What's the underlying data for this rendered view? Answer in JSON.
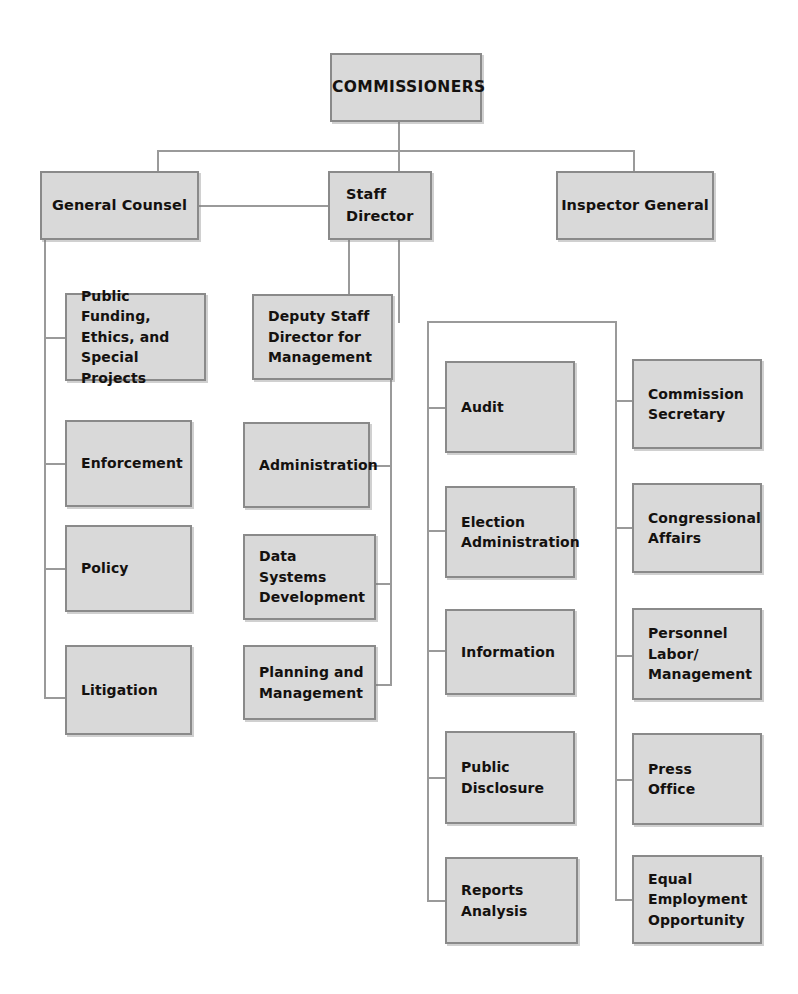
{
  "chart": {
    "type": "org-chart",
    "colors": {
      "box_fill": "#d9d9d9",
      "box_border": "#8a8a8a",
      "line": "#9a9a9a",
      "text": "#14110f",
      "background": "#ffffff"
    }
  },
  "nodes": {
    "root": {
      "label": "COMMISSIONERS"
    },
    "tier2": {
      "general_counsel": {
        "label": "General Counsel"
      },
      "staff_director": {
        "label": "Staff\nDirector"
      },
      "inspector_general": {
        "label": "Inspector General"
      }
    },
    "tier3": {
      "deputy_staff_director": {
        "label": "Deputy Staff\nDirector for\nManagement"
      }
    },
    "general_counsel_units": [
      {
        "label": "Public Funding,\nEthics, and\nSpecial Projects"
      },
      {
        "label": "Enforcement"
      },
      {
        "label": "Policy"
      },
      {
        "label": "Litigation"
      }
    ],
    "deputy_staff_director_units": [
      {
        "label": "Administration"
      },
      {
        "label": "Data\nSystems\nDevelopment"
      },
      {
        "label": "Planning and\nManagement"
      }
    ],
    "staff_director_units_left": [
      {
        "label": "Audit"
      },
      {
        "label": "Election\nAdministration"
      },
      {
        "label": "Information"
      },
      {
        "label": "Public\nDisclosure"
      },
      {
        "label": "Reports\nAnalysis"
      }
    ],
    "staff_director_units_right": [
      {
        "label": "Commission\nSecretary"
      },
      {
        "label": "Congressional\nAffairs"
      },
      {
        "label": "Personnel\nLabor/\nManagement"
      },
      {
        "label": "Press\nOffice"
      },
      {
        "label": "Equal\nEmployment\nOpportunity"
      }
    ]
  }
}
